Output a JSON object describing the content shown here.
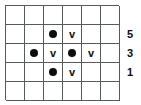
{
  "diagram": {
    "colors": {
      "background": "#ffffff",
      "grid_line": "#555b5e",
      "symbol": "#0d0d0d",
      "label": "#0d0d0d"
    },
    "grid": {
      "columns": 6,
      "rows": 5,
      "cell_size_px": 19,
      "rows_data": [
        {
          "index": 1,
          "cells": [
            "",
            "",
            "",
            "",
            "",
            ""
          ]
        },
        {
          "index": 2,
          "cells": [
            "",
            "",
            "dot",
            "v",
            "",
            ""
          ]
        },
        {
          "index": 3,
          "cells": [
            "",
            "dot",
            "v",
            "dot",
            "v",
            ""
          ]
        },
        {
          "index": 4,
          "cells": [
            "",
            "",
            "dot",
            "v",
            "",
            ""
          ]
        },
        {
          "index": 5,
          "cells": [
            "",
            "",
            "",
            "",
            "",
            ""
          ]
        }
      ]
    },
    "row_labels": [
      {
        "row": 1,
        "text": ""
      },
      {
        "row": 2,
        "text": "5"
      },
      {
        "row": 3,
        "text": "3"
      },
      {
        "row": 4,
        "text": "1"
      },
      {
        "row": 5,
        "text": ""
      }
    ],
    "symbol_glyphs": {
      "dot": "●",
      "v": "v"
    }
  },
  "chart_data": {
    "type": "heatmap",
    "title": "",
    "xlabel": "",
    "ylabel": "",
    "grid": true,
    "columns": 6,
    "rows": 5,
    "legend": [
      {
        "key": "dot",
        "label": "filled circle"
      },
      {
        "key": "v",
        "label": "letter v"
      }
    ],
    "cells": [
      {
        "row": 2,
        "col": 3,
        "symbol": "dot"
      },
      {
        "row": 2,
        "col": 4,
        "symbol": "v"
      },
      {
        "row": 3,
        "col": 2,
        "symbol": "dot"
      },
      {
        "row": 3,
        "col": 3,
        "symbol": "v"
      },
      {
        "row": 3,
        "col": 4,
        "symbol": "dot"
      },
      {
        "row": 3,
        "col": 5,
        "symbol": "v"
      },
      {
        "row": 4,
        "col": 3,
        "symbol": "dot"
      },
      {
        "row": 4,
        "col": 4,
        "symbol": "v"
      }
    ],
    "row_tick_labels": [
      "",
      "5",
      "3",
      "1",
      ""
    ],
    "row_tick_values": [
      null,
      5,
      3,
      1,
      null
    ]
  }
}
